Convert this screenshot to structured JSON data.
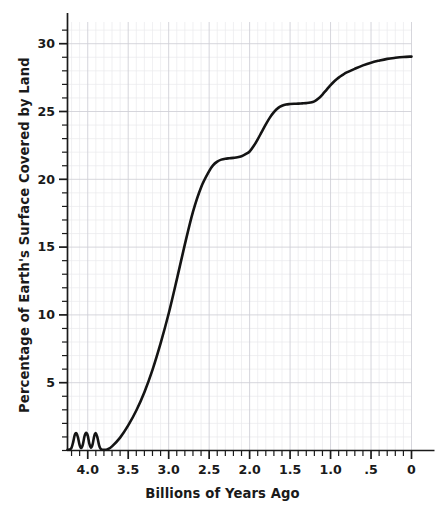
{
  "chart_data": {
    "type": "line",
    "title": "",
    "xlabel": "Billions of Years Ago",
    "ylabel": "Percentage of Earth's Surface Covered by Land",
    "xlim": [
      4.25,
      0
    ],
    "ylim": [
      0,
      31.6
    ],
    "x_axis_reversed": true,
    "grid": true,
    "grid_minor_spacing_x": 0.1,
    "grid_minor_spacing_y": 1,
    "legend_position": "none",
    "xticks_major": [
      "4.0",
      "3.5",
      "3.0",
      "2.5",
      "2.0",
      "1.5",
      "1.0",
      ".5",
      "0"
    ],
    "xticks_major_values": [
      4.0,
      3.5,
      3.0,
      2.5,
      2.0,
      1.5,
      1.0,
      0.5,
      0.0
    ],
    "xticks_minor_step": 0.1,
    "yticks_major": [
      "5",
      "10",
      "15",
      "20",
      "25",
      "30"
    ],
    "yticks_major_values": [
      5,
      10,
      15,
      20,
      25,
      30
    ],
    "yticks_minor_step": 1,
    "series": [
      {
        "name": "Percentage of Earth's Surface Covered by Land",
        "color": "#141414",
        "linewidth": 2.6,
        "x": [
          4.25,
          4.22,
          4.2,
          4.18,
          4.16,
          4.14,
          4.12,
          4.1,
          4.08,
          4.06,
          4.04,
          4.02,
          4.0,
          3.98,
          3.96,
          3.94,
          3.92,
          3.9,
          3.88,
          3.86,
          3.84,
          3.8,
          3.75,
          3.7,
          3.6,
          3.5,
          3.4,
          3.3,
          3.2,
          3.1,
          3.0,
          2.9,
          2.8,
          2.7,
          2.6,
          2.5,
          2.45,
          2.4,
          2.35,
          2.3,
          2.25,
          2.2,
          2.15,
          2.1,
          2.05,
          2.0,
          1.95,
          1.9,
          1.85,
          1.8,
          1.75,
          1.7,
          1.65,
          1.6,
          1.55,
          1.5,
          1.45,
          1.4,
          1.35,
          1.3,
          1.25,
          1.2,
          1.15,
          1.1,
          1.05,
          1.0,
          0.95,
          0.9,
          0.85,
          0.8,
          0.7,
          0.6,
          0.5,
          0.4,
          0.3,
          0.2,
          0.1,
          0.0
        ],
        "y": [
          0.05,
          0.08,
          0.2,
          0.62,
          1.15,
          1.28,
          0.95,
          0.4,
          0.18,
          0.45,
          1.05,
          1.3,
          1.1,
          0.5,
          0.2,
          0.45,
          1.05,
          1.28,
          0.95,
          0.4,
          0.12,
          0.05,
          0.1,
          0.3,
          0.95,
          1.85,
          2.95,
          4.3,
          5.95,
          7.9,
          10.1,
          12.6,
          15.2,
          17.6,
          19.4,
          20.6,
          21.05,
          21.3,
          21.45,
          21.52,
          21.55,
          21.58,
          21.62,
          21.7,
          21.85,
          22.05,
          22.45,
          22.95,
          23.5,
          24.05,
          24.55,
          24.95,
          25.25,
          25.42,
          25.52,
          25.55,
          25.57,
          25.58,
          25.6,
          25.62,
          25.66,
          25.75,
          25.95,
          26.25,
          26.6,
          26.95,
          27.25,
          27.5,
          27.7,
          27.88,
          28.15,
          28.4,
          28.6,
          28.75,
          28.88,
          28.96,
          29.02,
          29.05
        ]
      }
    ],
    "annotations": [
      {
        "text": "four small oscillation peaks reaching ~1.3% between 4.22 and 3.88 Gya",
        "visible_as": "curve-feature"
      },
      {
        "text": "plateau near 21.5% between 2.35 and 2.05 Gya",
        "visible_as": "curve-feature"
      },
      {
        "text": "plateau near 25.5% between 1.50 and 1.20 Gya",
        "visible_as": "curve-feature"
      },
      {
        "text": "final value ~29% at 0 Gya",
        "visible_as": "curve-feature"
      }
    ]
  },
  "axis": {
    "x_title": "Billions of Years Ago",
    "y_title": "Percentage of Earth's Surface Covered by Land"
  },
  "colors": {
    "line": "#141414",
    "axis": "#1a1a1a",
    "grid_minor": "#e9e9ec",
    "grid_major": "#cfcfd6",
    "background": "#ffffff",
    "text": "#1a1a1a"
  }
}
